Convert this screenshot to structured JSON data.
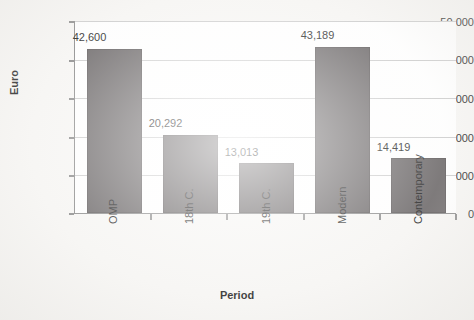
{
  "chart_data": {
    "type": "bar",
    "title": "",
    "xlabel": "Period",
    "ylabel": "Euro",
    "categories": [
      "OMP",
      "18th C.",
      "19th C.",
      "Modern",
      "Contemporary"
    ],
    "values": [
      42600,
      20292,
      13013,
      43189,
      14419
    ],
    "value_labels": [
      "42,600",
      "20,292",
      "13,013",
      "43,189",
      "14,419"
    ],
    "ylim": [
      0,
      50000
    ],
    "ytick_values": [
      0,
      10000,
      20000,
      30000,
      40000,
      50000
    ],
    "ytick_labels": [
      "0",
      "10,000",
      "20,000",
      "30,000",
      "40,000",
      "50,000"
    ],
    "grid": "horizontal",
    "legend": "none",
    "bar_color": "#696566",
    "plot_background": "#ffffff",
    "gridline_color": "#cdcdcd",
    "axis_color": "#8a8a8a",
    "xtick_label_rotation": -90
  }
}
